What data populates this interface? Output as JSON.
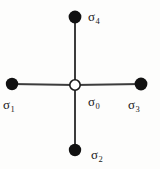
{
  "figure": {
    "kind": "node-link-diagram",
    "background_color": "#fdfdfc",
    "edge_color": "#3c3c3c",
    "filled_node_color": "#111111",
    "open_node_fill": "#ffffff",
    "open_node_stroke": "#1a1a1a"
  },
  "nodes": [
    {
      "id": "center",
      "symbol": "σ",
      "subscript": "0",
      "label": "σ₀",
      "style": "open",
      "x": 75,
      "y": 85,
      "radius": 5.2,
      "label_position": "lower-right"
    },
    {
      "id": "left",
      "symbol": "σ",
      "subscript": "1",
      "label": "σ₁",
      "style": "filled",
      "x": 12,
      "y": 84,
      "radius": 6.2,
      "label_position": "below"
    },
    {
      "id": "bottom",
      "symbol": "σ",
      "subscript": "2",
      "label": "σ₂",
      "style": "filled",
      "x": 75,
      "y": 150,
      "radius": 6.2,
      "label_position": "right"
    },
    {
      "id": "right",
      "symbol": "σ",
      "subscript": "3",
      "label": "σ₃",
      "style": "filled",
      "x": 141,
      "y": 84,
      "radius": 6.4,
      "label_position": "below"
    },
    {
      "id": "top",
      "symbol": "σ",
      "subscript": "4",
      "label": "σ₄",
      "style": "filled",
      "x": 75,
      "y": 17,
      "radius": 6.4,
      "label_position": "right"
    }
  ],
  "edges": [
    {
      "id": "edge-center-left",
      "from": "center",
      "to": "left"
    },
    {
      "id": "edge-center-right",
      "from": "center",
      "to": "right"
    },
    {
      "id": "edge-center-top",
      "from": "center",
      "to": "top"
    },
    {
      "id": "edge-center-bottom",
      "from": "center",
      "to": "bottom"
    }
  ]
}
